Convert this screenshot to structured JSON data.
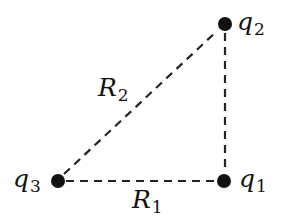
{
  "diagram": {
    "type": "charge-triangle",
    "colors": {
      "line": "#222222",
      "dot": "#111111",
      "text": "#111111",
      "background": "#ffffff"
    },
    "charges": [
      {
        "id": "q1",
        "symbol": "q",
        "subscript": "1",
        "x": 224,
        "y": 181
      },
      {
        "id": "q2",
        "symbol": "q",
        "subscript": "2",
        "x": 225,
        "y": 24
      },
      {
        "id": "q3",
        "symbol": "q",
        "subscript": "3",
        "x": 57,
        "y": 181
      }
    ],
    "distances": [
      {
        "id": "R1",
        "symbol": "R",
        "subscript": "1",
        "from": "q3",
        "to": "q1"
      },
      {
        "id": "R2",
        "symbol": "R",
        "subscript": "2",
        "from": "q3",
        "to": "q2"
      }
    ],
    "unlabeled_lines": [
      {
        "from": "q1",
        "to": "q2"
      }
    ]
  }
}
